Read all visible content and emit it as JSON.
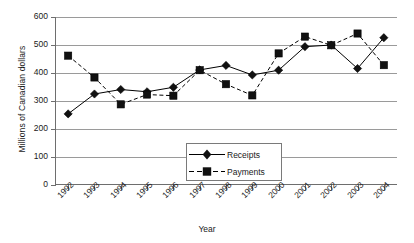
{
  "chart_data": {
    "type": "line",
    "title": "",
    "xlabel": "Year",
    "ylabel": "Millions of Canadian dollars",
    "categories": [
      "1992",
      "1993",
      "1994",
      "1995",
      "1996",
      "1997",
      "1998",
      "1999",
      "2000",
      "2001",
      "2002",
      "2003",
      "2004"
    ],
    "series": [
      {
        "name": "Receipts",
        "marker": "diamond",
        "linestyle": "solid",
        "color": "#000000",
        "values": [
          254,
          325,
          341,
          333,
          349,
          411,
          427,
          393,
          410,
          494,
          500,
          416,
          526
        ]
      },
      {
        "name": "Payments",
        "marker": "square",
        "linestyle": "dashed",
        "color": "#000000",
        "values": [
          462,
          384,
          288,
          323,
          319,
          410,
          360,
          320,
          470,
          530,
          499,
          541,
          428
        ]
      }
    ],
    "ylim": [
      0,
      600
    ],
    "yticks": [
      0,
      100,
      200,
      300,
      400,
      500,
      600
    ],
    "ytick_labels": [
      "0",
      "100",
      "200",
      "300",
      "400",
      "500",
      "600"
    ],
    "grid": "horizontal",
    "legend_position": "center-bottom-inside"
  },
  "axes": {
    "y_title": "Millions of Canadian dollars",
    "x_title": "Year"
  },
  "legend": {
    "entries": [
      {
        "label": "Receipts"
      },
      {
        "label": "Payments"
      }
    ]
  }
}
